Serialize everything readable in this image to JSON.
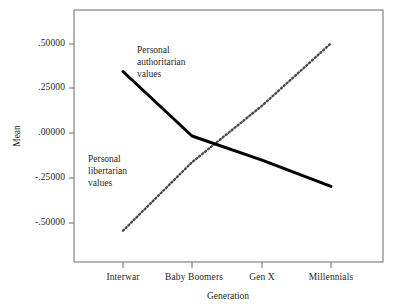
{
  "chart_data": {
    "type": "line",
    "title": "",
    "xlabel": "Generation",
    "ylabel": "Mean",
    "categories": [
      "Interwar",
      "Baby Boomers",
      "Gen X",
      "Millennials"
    ],
    "ylim": [
      -0.625,
      0.625
    ],
    "yticks": [
      0.5,
      0.25,
      0.0,
      -0.25,
      -0.5
    ],
    "ytick_labels": [
      ".50000",
      ".25000",
      ".00000",
      "-.25000",
      "-.50000"
    ],
    "grid": false,
    "legend": "annotations-inline",
    "series": [
      {
        "name": "Personal authoritarian values",
        "style": "solid",
        "color": "#000000",
        "width": 3,
        "values": [
          0.32,
          0.0,
          -0.12,
          -0.25
        ]
      },
      {
        "name": "Personal libertarian values",
        "style": "dotted",
        "color": "#555555",
        "width": 2.4,
        "values": [
          -0.47,
          -0.13,
          0.15,
          0.46
        ]
      }
    ],
    "annotations": [
      {
        "id": "authoritarian",
        "text": "Personal\nauthoritarian\nvalues",
        "x": 0.37,
        "y": 0.42
      },
      {
        "id": "libertarian",
        "text": "Personal\nlibertarian\nvalues",
        "x": 0.155,
        "y": -0.18
      }
    ]
  }
}
